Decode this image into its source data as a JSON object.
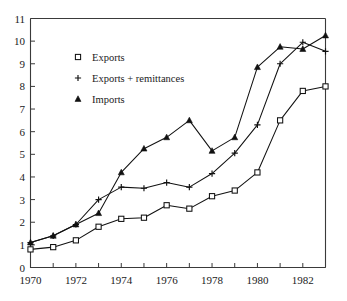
{
  "chart_data": {
    "type": "line",
    "title": "",
    "subtitle": "",
    "xlabel": "",
    "ylabel": "",
    "xlim": [
      1970,
      1983
    ],
    "ylim": [
      0,
      11
    ],
    "x": [
      1970,
      1971,
      1972,
      1973,
      1974,
      1975,
      1976,
      1977,
      1978,
      1979,
      1980,
      1981,
      1982,
      1983
    ],
    "xticks": [
      1970,
      1971,
      1972,
      1973,
      1974,
      1975,
      1976,
      1977,
      1978,
      1979,
      1980,
      1981,
      1982,
      1983
    ],
    "xtick_labels": [
      "1970",
      "",
      "1972",
      "",
      "1974",
      "",
      "1976",
      "",
      "1978",
      "",
      "1980",
      "",
      "1982",
      ""
    ],
    "yticks": [
      0,
      1,
      2,
      3,
      4,
      5,
      6,
      7,
      8,
      9,
      10,
      11
    ],
    "ytick_labels": [
      "0",
      "1",
      "2",
      "3",
      "4",
      "5",
      "6",
      "7",
      "8",
      "9",
      "10",
      "11"
    ],
    "grid": false,
    "legend_position": "upper left",
    "series": [
      {
        "name": "Exports",
        "marker": "open-square",
        "color": "#111111",
        "values": [
          0.8,
          0.9,
          1.2,
          1.8,
          2.15,
          2.2,
          2.75,
          2.6,
          3.15,
          3.4,
          4.2,
          6.5,
          7.8,
          8.0
        ]
      },
      {
        "name": "Exports + remittances",
        "marker": "plus",
        "color": "#111111",
        "values": [
          1.1,
          1.4,
          1.9,
          3.0,
          3.55,
          3.5,
          3.75,
          3.55,
          4.15,
          5.05,
          6.3,
          9.0,
          9.95,
          9.55
        ]
      },
      {
        "name": "Imports",
        "marker": "filled-triangle",
        "color": "#111111",
        "values": [
          1.1,
          1.4,
          1.9,
          2.4,
          4.2,
          5.25,
          5.75,
          6.5,
          5.15,
          5.75,
          8.85,
          9.75,
          9.65,
          10.25
        ]
      }
    ],
    "legend": [
      {
        "label": "Exports",
        "marker": "open-square"
      },
      {
        "label": "Exports + remittances",
        "marker": "plus"
      },
      {
        "label": "Imports",
        "marker": "filled-triangle"
      }
    ]
  },
  "axes": {
    "left_label": "",
    "bottom_label": ""
  }
}
